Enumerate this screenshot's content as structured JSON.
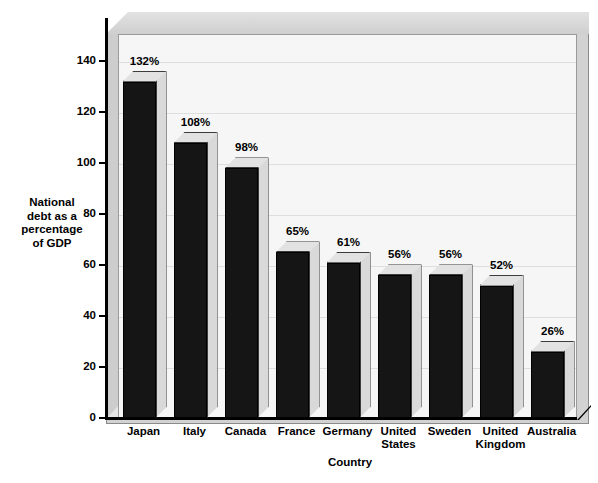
{
  "chart_data": {
    "type": "bar",
    "title": "",
    "xlabel": "Country",
    "ylabel": "National debt as a percentage of GDP",
    "ylabel_lines": [
      "National",
      "debt as a",
      "percentage",
      "of GDP"
    ],
    "categories": [
      "Japan",
      "Italy",
      "Canada",
      "France",
      "Germany",
      "United States",
      "Sweden",
      "United Kingdom",
      "Australia"
    ],
    "category_lines": [
      [
        "Japan"
      ],
      [
        "Italy"
      ],
      [
        "Canada"
      ],
      [
        "France"
      ],
      [
        "Germany"
      ],
      [
        "United",
        "States"
      ],
      [
        "Sweden"
      ],
      [
        "United",
        "Kingdom"
      ],
      [
        "Australia"
      ]
    ],
    "values": [
      132,
      108,
      98,
      65,
      61,
      56,
      56,
      52,
      26
    ],
    "data_labels": [
      "132%",
      "108%",
      "98%",
      "65%",
      "61%",
      "56%",
      "56%",
      "52%",
      "26%"
    ],
    "ylim": [
      0,
      150
    ],
    "yticks": [
      0,
      20,
      40,
      60,
      80,
      100,
      120,
      140
    ],
    "ytick_labels": [
      "0",
      "20",
      "40",
      "60",
      "80",
      "100",
      "120",
      "140"
    ],
    "grid": true,
    "legend": "none",
    "unit": "%",
    "style": "3d-column",
    "colors": {
      "bar_front": "#151515",
      "bar_side": "#d9d9d9",
      "bar_top": "#e2e2e2",
      "plot_background": "#f6f6f6",
      "frame_wall": "#d2d2d2",
      "axis": "#000000",
      "gridline": "#dedede",
      "text": "#000000",
      "page_background": "#ffffff"
    }
  }
}
